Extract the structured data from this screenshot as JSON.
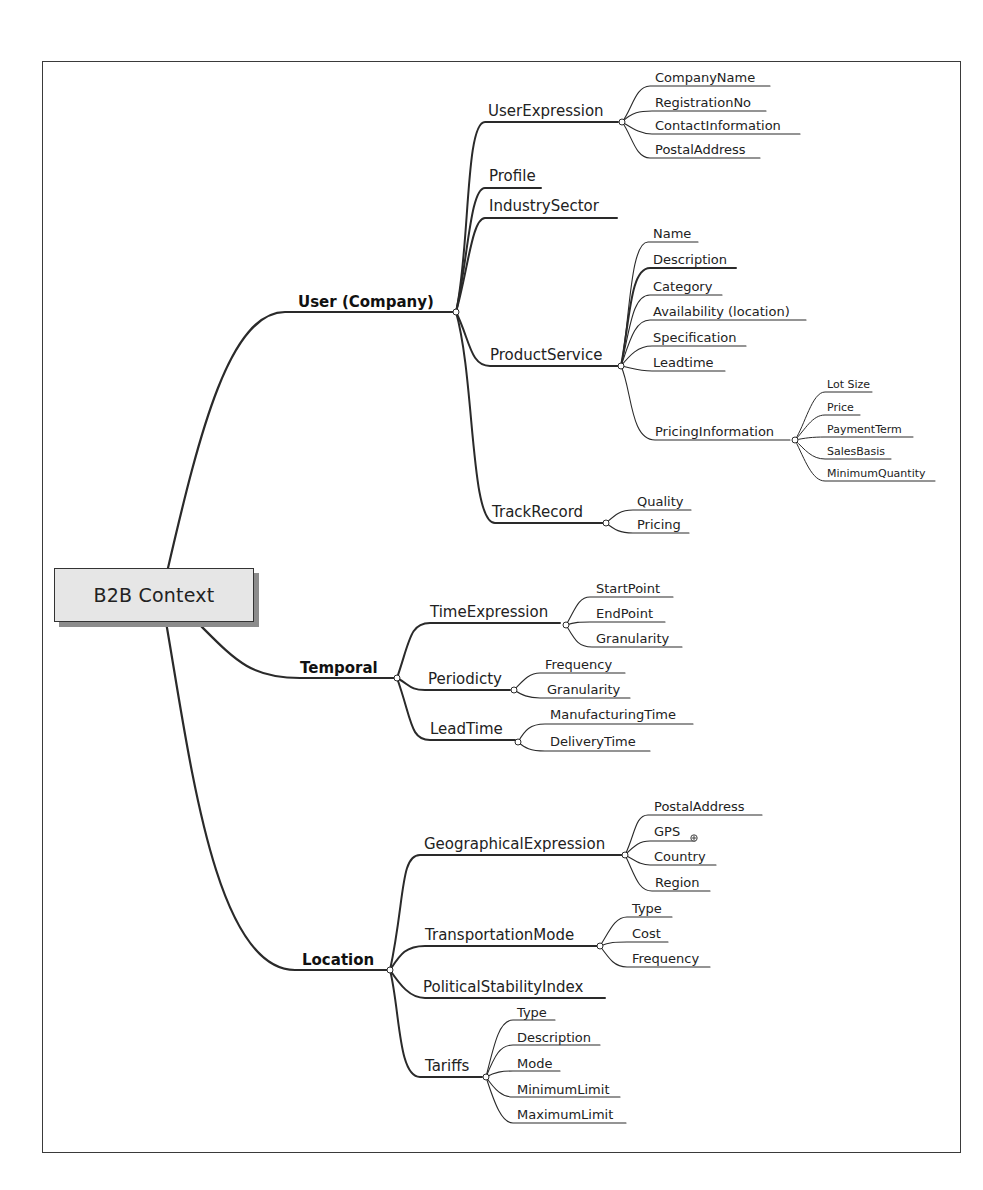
{
  "diagram": {
    "type": "mind-map",
    "root": {
      "label": "B2B Context"
    },
    "branches": [
      {
        "label": "User (Company)",
        "children": [
          {
            "label": "UserExpression",
            "children": [
              {
                "label": "CompanyName"
              },
              {
                "label": "RegistrationNo"
              },
              {
                "label": "ContactInformation"
              },
              {
                "label": "PostalAddress"
              }
            ]
          },
          {
            "label": "Profile"
          },
          {
            "label": "IndustrySector"
          },
          {
            "label": "ProductService",
            "children": [
              {
                "label": "Name"
              },
              {
                "label": "Description"
              },
              {
                "label": "Category"
              },
              {
                "label": "Availability (location)"
              },
              {
                "label": "Specification"
              },
              {
                "label": "Leadtime"
              },
              {
                "label": "PricingInformation",
                "children": [
                  {
                    "label": "Lot Size"
                  },
                  {
                    "label": "Price"
                  },
                  {
                    "label": "PaymentTerm"
                  },
                  {
                    "label": "SalesBasis"
                  },
                  {
                    "label": "MinimumQuantity"
                  }
                ]
              }
            ]
          },
          {
            "label": "TrackRecord",
            "children": [
              {
                "label": "Quality"
              },
              {
                "label": "Pricing"
              }
            ]
          }
        ]
      },
      {
        "label": "Temporal",
        "children": [
          {
            "label": "TimeExpression",
            "children": [
              {
                "label": "StartPoint"
              },
              {
                "label": "EndPoint"
              },
              {
                "label": "Granularity"
              }
            ]
          },
          {
            "label": "Periodicty",
            "children": [
              {
                "label": "Frequency"
              },
              {
                "label": "Granularity"
              }
            ]
          },
          {
            "label": "LeadTime",
            "children": [
              {
                "label": "ManufacturingTime"
              },
              {
                "label": "DeliveryTime"
              }
            ]
          }
        ]
      },
      {
        "label": "Location",
        "children": [
          {
            "label": "GeographicalExpression",
            "children": [
              {
                "label": "PostalAddress"
              },
              {
                "label": "GPS",
                "marker": "attachment-icon"
              },
              {
                "label": "Country"
              },
              {
                "label": "Region"
              }
            ]
          },
          {
            "label": "TransportationMode",
            "children": [
              {
                "label": "Type"
              },
              {
                "label": "Cost"
              },
              {
                "label": "Frequency"
              }
            ]
          },
          {
            "label": "PoliticalStabilityIndex"
          },
          {
            "label": "Tariffs",
            "children": [
              {
                "label": "Type"
              },
              {
                "label": "Description"
              },
              {
                "label": "Mode"
              },
              {
                "label": "MinimumLimit"
              },
              {
                "label": "MaximumLimit"
              }
            ]
          }
        ]
      }
    ]
  }
}
